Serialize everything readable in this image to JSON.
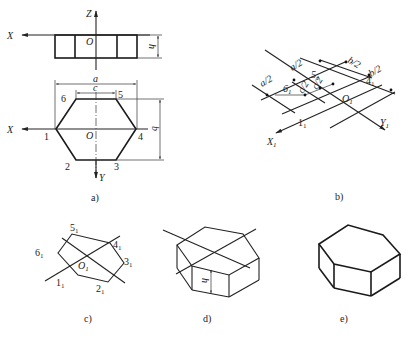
{
  "figure": {
    "colors": {
      "line": "#222222",
      "background": "#ffffff"
    },
    "view_a": {
      "caption": "a)",
      "front_view": {
        "axis_z": "Z",
        "axis_x": "X",
        "origin": "O",
        "height_label": "h"
      },
      "top_view": {
        "axis_x": "X",
        "axis_y": "Y",
        "origin": "O",
        "dim_a": "a",
        "dim_b": "b",
        "dim_c": "c",
        "vertices": [
          "1",
          "2",
          "3",
          "4",
          "5",
          "6"
        ]
      }
    },
    "view_b": {
      "caption": "b)",
      "axis_x": "X",
      "axis_x_sub": "1",
      "axis_y": "Y",
      "axis_y_sub": "1",
      "origin": "O",
      "origin_sub": "1",
      "dims": [
        "a/2",
        "a/2",
        "b/2",
        "b/2",
        "c/2",
        "c/2"
      ],
      "points": [
        {
          "base": "1",
          "sub": "1"
        },
        {
          "base": "4",
          "sub": "1"
        },
        {
          "base": "5",
          "sub": "1"
        },
        {
          "base": "6",
          "sub": "1"
        }
      ]
    },
    "view_c": {
      "caption": "c)",
      "origin": "O",
      "origin_sub": "1",
      "points": [
        {
          "base": "1",
          "sub": "1"
        },
        {
          "base": "2",
          "sub": "1"
        },
        {
          "base": "3",
          "sub": "1"
        },
        {
          "base": "4",
          "sub": "1"
        },
        {
          "base": "5",
          "sub": "1"
        },
        {
          "base": "6",
          "sub": "1"
        }
      ]
    },
    "view_d": {
      "caption": "d)",
      "height_label": "h"
    },
    "view_e": {
      "caption": "e)"
    }
  }
}
